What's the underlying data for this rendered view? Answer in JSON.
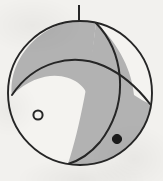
{
  "figure": {
    "kind": "focal-mechanism-beachball",
    "caption": "",
    "background_color": "#f2f1ee",
    "stroke_color": "#262626",
    "compressional_fill": "#b2b2b2",
    "dilatational_fill": "#f4f3f0"
  },
  "chart_data": {
    "type": "scatter",
    "title": "",
    "subtitle": "",
    "xlabel": "",
    "ylabel": "",
    "projection": "lower-hemisphere-equal-area",
    "grid": false,
    "legend": "none",
    "xlim": [
      -1,
      1
    ],
    "ylim": [
      -1,
      1
    ],
    "focal_sphere": {
      "center_x": 80,
      "center_y": 93,
      "radius": 72,
      "outline_width": 1.9
    },
    "north_tick": {
      "label": "north-tick",
      "x": 79,
      "y_top": 5,
      "y_bottom": 21,
      "width": 2.0
    },
    "quadrants": [
      {
        "name": "upper-left",
        "polarity": "compressional",
        "fill": "#b2b2b2"
      },
      {
        "name": "upper-right",
        "polarity": "dilatational",
        "fill": "#f4f3f0"
      },
      {
        "name": "lower-left",
        "polarity": "dilatational",
        "fill": "#f4f3f0"
      },
      {
        "name": "lower-right",
        "polarity": "compressional",
        "fill": "#b2b2b2"
      }
    ],
    "nodal_planes": [
      {
        "name": "nodal-plane-steep",
        "description": "steeply dipping plane running from upper right to lower centre",
        "start": [
          96,
          23
        ],
        "control": [
          128,
          95
        ],
        "end": [
          68,
          164
        ],
        "stroke_width": 2.0
      },
      {
        "name": "nodal-plane-shallow",
        "description": "shallow plane arcing from left edge to right edge",
        "start": [
          12,
          95
        ],
        "control": [
          80,
          57
        ],
        "end": [
          150,
          104
        ],
        "stroke_width": 2.0
      }
    ],
    "axes_markers": [
      {
        "name": "t-axis-marker",
        "symbol": "open-circle",
        "x": 38,
        "y": 115,
        "radius": 4.6,
        "fill": "none",
        "stroke": "#262626",
        "stroke_width": 2.0
      },
      {
        "name": "p-axis-marker",
        "symbol": "filled-circle",
        "x": 117,
        "y": 139,
        "radius": 4.6,
        "fill": "#1a1a1a",
        "stroke": "#1a1a1a",
        "stroke_width": 1.0
      }
    ],
    "annotations": []
  }
}
